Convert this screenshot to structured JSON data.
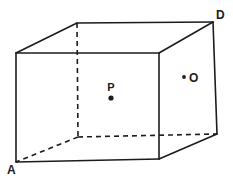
{
  "figure": {
    "type": "cuboid-diagram",
    "background": "#ffffff",
    "line_color": "#1c1c1c",
    "stroke_width": 1.6,
    "dash_pattern": "5 4",
    "width": 233,
    "height": 179,
    "vertices": {
      "front_top_left": [
        16,
        53
      ],
      "front_top_right": [
        159,
        53
      ],
      "front_bottom_left": [
        16,
        162
      ],
      "front_bottom_right": [
        159,
        159
      ],
      "back_top_left": [
        77,
        23
      ],
      "back_top_right": [
        213,
        22
      ],
      "back_bottom_left": [
        78,
        137
      ],
      "back_bottom_right": [
        217,
        134
      ]
    },
    "solid_edges": [
      [
        "front_top_left",
        "front_top_right"
      ],
      [
        "front_top_left",
        "front_bottom_left"
      ],
      [
        "front_top_right",
        "front_bottom_right"
      ],
      [
        "front_bottom_left",
        "front_bottom_right"
      ],
      [
        "front_top_left",
        "back_top_left"
      ],
      [
        "back_top_left",
        "back_top_right"
      ],
      [
        "back_top_right",
        "front_top_right"
      ],
      [
        "back_top_right",
        "back_bottom_right"
      ],
      [
        "back_bottom_right",
        "front_bottom_right"
      ]
    ],
    "dashed_edges": [
      [
        "back_top_left",
        "back_bottom_left"
      ],
      [
        "back_bottom_left",
        "front_bottom_left"
      ],
      [
        "back_bottom_left",
        "back_bottom_right"
      ]
    ],
    "corner_labels": [
      {
        "text": "D",
        "x": 216,
        "y": 19,
        "anchor": "start",
        "font_size": 12
      },
      {
        "text": "A",
        "x": 7,
        "y": 174,
        "anchor": "start",
        "font_size": 12
      }
    ],
    "points": [
      {
        "label": "P",
        "dot_x": 111,
        "dot_y": 98,
        "dot_r": 2.6,
        "label_x": 111,
        "label_y": 91,
        "anchor": "middle",
        "font_size": 11
      },
      {
        "label": "O",
        "dot_x": 184,
        "dot_y": 77,
        "dot_r": 1.9,
        "label_x": 189,
        "label_y": 82,
        "anchor": "start",
        "font_size": 12
      }
    ]
  }
}
